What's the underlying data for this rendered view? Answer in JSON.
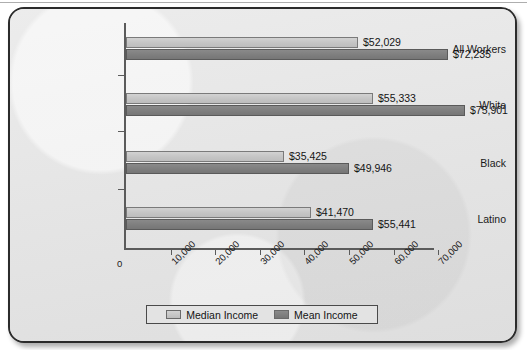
{
  "chart_data": {
    "type": "bar",
    "orientation": "horizontal",
    "title": "",
    "xlabel": "",
    "ylabel": "",
    "xlim": [
      0,
      75000
    ],
    "grid": false,
    "legend_position": "bottom",
    "categories": [
      "All Workers",
      "White",
      "Black",
      "Latino"
    ],
    "tick_labels": [
      "0",
      "10,000",
      "20,000",
      "30,000",
      "40,000",
      "50,000",
      "60,000",
      "70,000"
    ],
    "tick_values": [
      0,
      10000,
      20000,
      30000,
      40000,
      50000,
      60000,
      70000
    ],
    "series": [
      {
        "name": "Median Income",
        "color": "#c4c4c4",
        "values": [
          52029,
          55333,
          35425,
          41470
        ],
        "value_labels": [
          "$52,029",
          "$55,333",
          "$35,425",
          "$41,470"
        ]
      },
      {
        "name": "Mean Income",
        "color": "#7e7e7e",
        "values": [
          72235,
          75901,
          49946,
          55441
        ],
        "value_labels": [
          "$72,235",
          "$75,901",
          "$49,946",
          "$55,441"
        ]
      }
    ]
  },
  "legend": {
    "items": [
      {
        "label": "Median Income",
        "swatch": "median"
      },
      {
        "label": "Mean Income",
        "swatch": "mean"
      }
    ]
  }
}
